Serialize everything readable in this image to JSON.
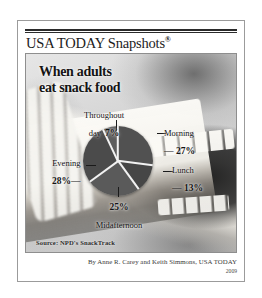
{
  "masthead": {
    "title": "USA TODAY Snapshots",
    "registered_mark": "®"
  },
  "headline": {
    "line1": "When adults",
    "line2": "eat snack food"
  },
  "source": {
    "text": "Source: NPD's SnackTrack"
  },
  "byline": {
    "text": "By Anne R. Carey and Keith Simmons, USA TODAY",
    "year": "2009"
  },
  "chart_data": {
    "type": "pie",
    "title": "When adults eat snack food",
    "source": "NPD's SnackTrack",
    "unit": "percent",
    "legend_position": "callout-labels",
    "categories": [
      "Morning",
      "Lunch",
      "Midafternoon",
      "Evening",
      "Throughout day"
    ],
    "values": [
      27,
      13,
      25,
      28,
      7
    ],
    "slices": [
      {
        "label": "Morning",
        "value": 27,
        "value_text": "27%",
        "start_deg": 0,
        "sweep_deg": 97.2,
        "color": "#555555"
      },
      {
        "label": "Lunch",
        "value": 13,
        "value_text": "13%",
        "start_deg": 97.2,
        "sweep_deg": 46.8,
        "color": "#4a4a4a"
      },
      {
        "label": "Midafternoon",
        "value": 25,
        "value_text": "25%",
        "start_deg": 144.0,
        "sweep_deg": 90.0,
        "color": "#5e5e5e"
      },
      {
        "label": "Evening",
        "value": 28,
        "value_text": "28%",
        "start_deg": 234.0,
        "sweep_deg": 100.8,
        "color": "#4f4f4f"
      },
      {
        "label": "Throughout day",
        "value": 7,
        "value_text": "7%",
        "start_deg": 334.8,
        "sweep_deg": 25.2,
        "color": "#606060"
      }
    ],
    "labels": {
      "throughout": {
        "name_line1": "Throughout",
        "name_line2": "day",
        "pct": "7%"
      },
      "morning": {
        "name": "Morning",
        "pct": "— 27%"
      },
      "lunch": {
        "name": "Lunch",
        "pct": "— 13%"
      },
      "evening": {
        "name": "Evening",
        "pct": "28%—"
      },
      "midafternoon": {
        "pct": "25%",
        "name": "Midafternoon"
      }
    }
  },
  "colors": {
    "frame": "#9b9b9b",
    "rule": "#2b2b2b",
    "text": "#141414",
    "pie_fill": "#555555",
    "pie_separator": "#f2f2f2"
  }
}
